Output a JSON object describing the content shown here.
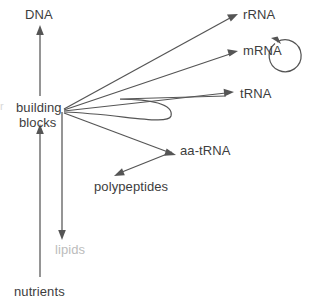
{
  "diagram": {
    "background_color": "#ffffff",
    "line_color": "#555555",
    "text_color": "#3d3d3d",
    "dim_text_color": "#bcbcbc",
    "nodes": [
      {
        "id": "dna",
        "label": "DNA",
        "x": 25,
        "y": 8,
        "style": "normal"
      },
      {
        "id": "building",
        "label": "building",
        "x": 16,
        "y": 100,
        "style": "normal"
      },
      {
        "id": "blocks",
        "label": "blocks",
        "x": 19,
        "y": 115,
        "style": "normal"
      },
      {
        "id": "rrna",
        "label": "rRNA",
        "x": 243,
        "y": 8,
        "style": "normal"
      },
      {
        "id": "mrna",
        "label": "mRNA",
        "x": 243,
        "y": 44,
        "style": "normal"
      },
      {
        "id": "trna",
        "label": "tRNA",
        "x": 240,
        "y": 87,
        "style": "normal"
      },
      {
        "id": "aatrna",
        "label": "aa-tRNA",
        "x": 180,
        "y": 144,
        "style": "normal"
      },
      {
        "id": "polypeptides",
        "label": "polypeptides",
        "x": 94,
        "y": 180,
        "style": "normal"
      },
      {
        "id": "lipids",
        "label": "lipids",
        "x": 55,
        "y": 243,
        "style": "dim"
      },
      {
        "id": "nutrients",
        "label": "nutrients",
        "x": 14,
        "y": 285,
        "style": "normal"
      }
    ],
    "edges": [
      {
        "id": "nutrients-to-building",
        "from": "nutrients",
        "to": "building",
        "kind": "straight-arrow",
        "direction": "up"
      },
      {
        "id": "building-to-dna",
        "from": "building",
        "to": "dna",
        "kind": "straight-arrow",
        "direction": "up"
      },
      {
        "id": "building-to-lipids",
        "from": "building",
        "to": "lipids",
        "kind": "straight-arrow",
        "direction": "down"
      },
      {
        "id": "building-to-rrna",
        "from": "building",
        "to": "rrna",
        "kind": "straight-arrow",
        "direction": "up-right"
      },
      {
        "id": "building-to-mrna",
        "from": "building",
        "to": "mrna",
        "kind": "straight-arrow",
        "direction": "up-right"
      },
      {
        "id": "building-to-trna",
        "from": "building",
        "to": "trna",
        "kind": "straight-arrow",
        "direction": "right"
      },
      {
        "id": "trna-curve-to-aatrna",
        "from": "building",
        "to": "aa-tRNA",
        "kind": "curved-arrow",
        "direction": "loop-right"
      },
      {
        "id": "building-to-aatrna",
        "from": "building",
        "to": "aa-tRNA",
        "kind": "straight-arrow",
        "direction": "down-right"
      },
      {
        "id": "aatrna-to-polypeptides",
        "from": "aa-tRNA",
        "to": "polypeptides",
        "kind": "straight-arrow",
        "direction": "down-left"
      },
      {
        "id": "mrna-self-loop",
        "from": "mrna",
        "to": "mrna",
        "kind": "circular-arrow",
        "direction": "clockwise"
      }
    ],
    "margin_mark": "r"
  }
}
